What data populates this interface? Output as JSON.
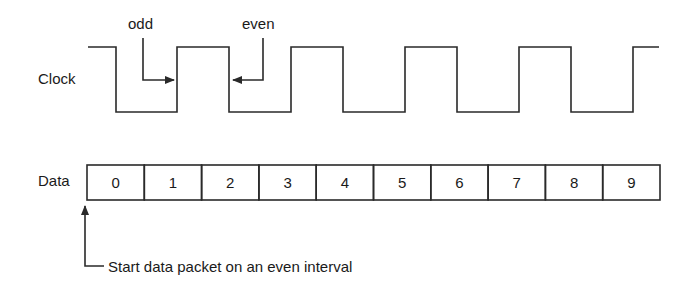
{
  "diagram": {
    "clock": {
      "label": "Clock",
      "high_y": 47,
      "low_y": 112,
      "points": [
        [
          88,
          47
        ],
        [
          116,
          47
        ],
        [
          116,
          112
        ],
        [
          177,
          112
        ],
        [
          177,
          47
        ],
        [
          229,
          47
        ],
        [
          229,
          112
        ],
        [
          291,
          112
        ],
        [
          291,
          47
        ],
        [
          343,
          47
        ],
        [
          343,
          112
        ],
        [
          405,
          112
        ],
        [
          405,
          47
        ],
        [
          457,
          47
        ],
        [
          457,
          112
        ],
        [
          519,
          112
        ],
        [
          519,
          47
        ],
        [
          571,
          47
        ],
        [
          571,
          112
        ],
        [
          633,
          112
        ],
        [
          633,
          47
        ],
        [
          659,
          47
        ]
      ]
    },
    "annotations": {
      "odd": {
        "label": "odd"
      },
      "even": {
        "label": "even"
      }
    },
    "data": {
      "label": "Data",
      "cells": [
        "0",
        "1",
        "2",
        "3",
        "4",
        "5",
        "6",
        "7",
        "8",
        "9"
      ]
    },
    "start_note": {
      "label": "Start data packet on an even interval"
    },
    "colors": {
      "line": "#2a2a2a",
      "text": "#1a1a1a",
      "background": "#ffffff"
    }
  }
}
